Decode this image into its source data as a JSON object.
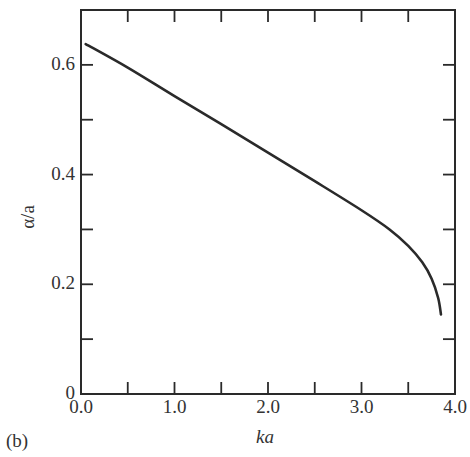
{
  "chart_data": {
    "type": "line",
    "title": "",
    "panel_label": "(b)",
    "xlabel": "ka",
    "ylabel": "α/a",
    "xlim": [
      0.0,
      4.0
    ],
    "ylim": [
      0.0,
      0.7
    ],
    "grid": false,
    "legend": null,
    "x_tick_labels": [
      "0.0",
      "1.0",
      "2.0",
      "3.0",
      "4.0"
    ],
    "y_tick_labels": [
      "0",
      "0.2",
      "0.4",
      "0.6"
    ],
    "series": [
      {
        "name": "α/a vs ka",
        "x": [
          0.05,
          0.5,
          1.0,
          1.5,
          2.0,
          2.5,
          3.0,
          3.3,
          3.5,
          3.65,
          3.75,
          3.82,
          3.85
        ],
        "y": [
          0.638,
          0.595,
          0.543,
          0.492,
          0.44,
          0.388,
          0.335,
          0.3,
          0.27,
          0.24,
          0.21,
          0.175,
          0.145
        ]
      }
    ]
  }
}
